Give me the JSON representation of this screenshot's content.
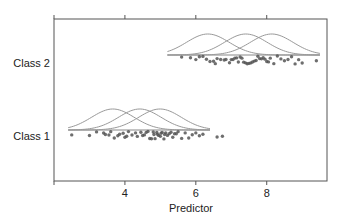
{
  "chart_data": {
    "type": "scatter",
    "title": "",
    "xlabel": "Predictor",
    "ylabel": "",
    "xlim": [
      2.0,
      9.7
    ],
    "x_ticks": [
      4,
      6,
      8
    ],
    "x_tick_labels": [
      "4",
      "6",
      "8"
    ],
    "top_ticks": [
      4,
      6,
      8
    ],
    "grid": false,
    "legend": "none",
    "categories": [
      "Class 1",
      "Class 2"
    ],
    "series": [
      {
        "name": "Class 1",
        "points": [
          2.5,
          3.0,
          3.2,
          3.4,
          3.45,
          3.55,
          3.6,
          3.7,
          3.8,
          3.85,
          3.95,
          4.0,
          4.05,
          4.1,
          4.2,
          4.3,
          4.35,
          4.45,
          4.5,
          4.55,
          4.6,
          4.65,
          4.7,
          4.75,
          4.8,
          4.82,
          4.85,
          4.9,
          4.92,
          4.95,
          5.0,
          5.02,
          5.05,
          5.1,
          5.12,
          5.15,
          5.2,
          5.25,
          5.3,
          5.35,
          5.4,
          5.45,
          5.5,
          5.6,
          5.7,
          5.8,
          5.9,
          6.0,
          6.1,
          6.2,
          6.6,
          6.75
        ],
        "densities": [
          {
            "mean": 3.66,
            "sd": 0.6
          },
          {
            "mean": 4.42,
            "sd": 0.6
          },
          {
            "mean": 4.99,
            "sd": 0.6
          }
        ],
        "density_range": [
          2.4,
          6.4
        ]
      },
      {
        "name": "Class 2",
        "points": [
          5.6,
          5.85,
          6.0,
          6.1,
          6.2,
          6.3,
          6.4,
          6.5,
          6.55,
          6.6,
          6.7,
          6.8,
          6.85,
          6.95,
          7.0,
          7.05,
          7.1,
          7.15,
          7.2,
          7.25,
          7.3,
          7.35,
          7.4,
          7.45,
          7.5,
          7.55,
          7.6,
          7.65,
          7.7,
          7.75,
          7.8,
          7.85,
          7.9,
          7.95,
          8.0,
          8.05,
          8.1,
          8.2,
          8.3,
          8.4,
          8.5,
          8.6,
          8.7,
          8.8,
          8.9,
          9.0,
          9.4
        ],
        "densities": [
          {
            "mean": 6.34,
            "sd": 0.6
          },
          {
            "mean": 7.41,
            "sd": 0.6
          },
          {
            "mean": 8.14,
            "sd": 0.6
          }
        ],
        "density_range": [
          5.2,
          9.5
        ]
      }
    ]
  }
}
